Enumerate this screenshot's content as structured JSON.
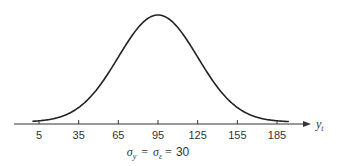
{
  "chart_data": {
    "type": "line",
    "title": "",
    "xlabel": "y",
    "xlabel_subscript": "t",
    "ylabel": "",
    "x_ticks": [
      5,
      35,
      65,
      95,
      125,
      155,
      185
    ],
    "x_tick_labels": [
      "5",
      "35",
      "65",
      "95",
      "125",
      "155",
      "185"
    ],
    "xlim": [
      -1,
      194
    ],
    "distribution": {
      "mean": 95,
      "sd": 30
    },
    "curve_range": [
      0,
      194
    ],
    "grid": false,
    "legend": null,
    "annotation": {
      "sigma1_sym": "σ",
      "sigma1_sub": "y",
      "eq1": "=",
      "sigma2_sym": "σ",
      "sigma2_sub": "ε",
      "eq2": "=",
      "value": "30"
    }
  }
}
